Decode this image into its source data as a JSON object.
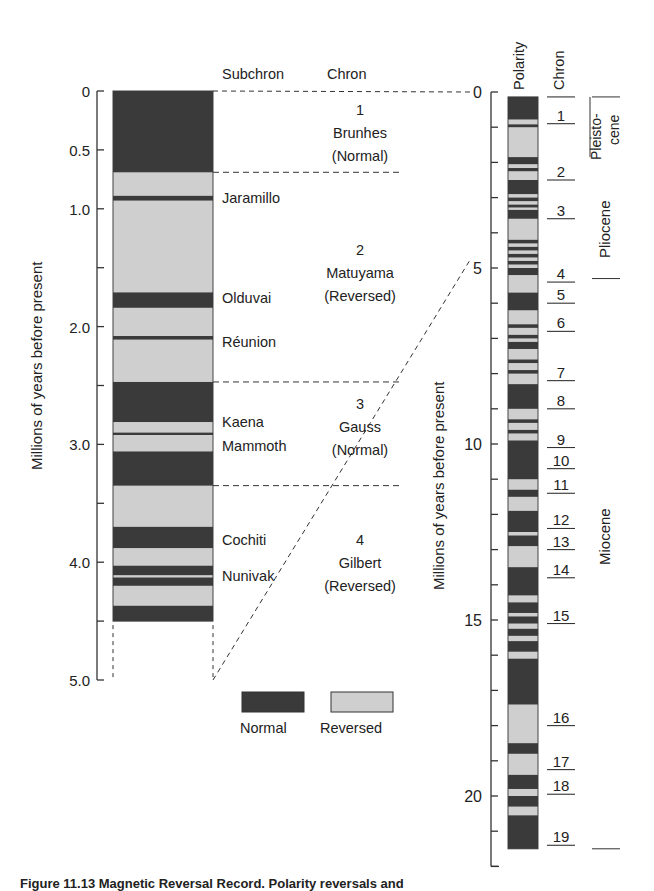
{
  "chart_data": {
    "type": "diagram",
    "left_panel": {
      "ylabel": "Millions of years before present",
      "yticks": [
        "0",
        "0.5",
        "1.0",
        "2.0",
        "3.0",
        "4.0",
        "5.0"
      ],
      "ylim": [
        0,
        5.0
      ],
      "column_headers": [
        "Subchron",
        "Chron"
      ],
      "normal_bands_ma": [
        [
          0,
          0.69
        ],
        [
          0.89,
          0.93
        ],
        [
          1.71,
          1.84
        ],
        [
          2.08,
          2.11
        ],
        [
          2.47,
          2.81
        ],
        [
          2.9,
          2.92
        ],
        [
          3.06,
          3.35
        ],
        [
          3.7,
          3.88
        ],
        [
          4.03,
          4.11
        ],
        [
          4.13,
          4.2
        ],
        [
          4.37,
          4.5
        ]
      ],
      "column_end_ma": 4.5,
      "subchrons": [
        {
          "name": "Jaramillo",
          "age": 0.91
        },
        {
          "name": "Olduvai",
          "age": 1.78
        },
        {
          "name": "Réunion",
          "age": 2.14
        },
        {
          "name": "Kaena",
          "age": 2.84
        },
        {
          "name": "Mammoth",
          "age": 3.0
        },
        {
          "name": "Cochiti",
          "age": 3.79
        },
        {
          "name": "Nunivak",
          "age": 4.09
        }
      ],
      "chrons": [
        {
          "number": "1",
          "name": "Brunhes",
          "polarity": "(Normal)",
          "start": 0,
          "end": 0.69
        },
        {
          "number": "2",
          "name": "Matuyama",
          "polarity": "(Reversed)",
          "start": 0.69,
          "end": 2.47
        },
        {
          "number": "3",
          "name": "Gauss",
          "polarity": "(Normal)",
          "start": 2.47,
          "end": 3.35
        },
        {
          "number": "4",
          "name": "Gilbert",
          "polarity": "(Reversed)",
          "start": 3.35,
          "end": 5.0
        }
      ]
    },
    "right_panel": {
      "ylabel": "Millions of years before present",
      "yticks": [
        "0",
        "5",
        "10",
        "15",
        "20"
      ],
      "ylim": [
        0,
        22
      ],
      "column_headers": [
        "Polarity",
        "Chron"
      ],
      "column_end_ma": 21.5,
      "normal_bands_ma": [
        [
          0,
          0.78
        ],
        [
          0.92,
          1.0
        ],
        [
          1.85,
          2.05
        ],
        [
          2.16,
          2.25
        ],
        [
          2.5,
          2.9
        ],
        [
          3.0,
          3.1
        ],
        [
          3.2,
          3.28
        ],
        [
          3.35,
          3.6
        ],
        [
          4.2,
          4.3
        ],
        [
          4.4,
          4.5
        ],
        [
          4.6,
          4.7
        ],
        [
          4.8,
          4.9
        ],
        [
          5.0,
          5.2
        ],
        [
          5.7,
          6.2
        ],
        [
          6.6,
          6.7
        ],
        [
          6.9,
          7.0
        ],
        [
          7.1,
          7.3
        ],
        [
          7.6,
          7.7
        ],
        [
          7.9,
          8.0
        ],
        [
          8.3,
          9.0
        ],
        [
          9.3,
          9.4
        ],
        [
          9.6,
          9.7
        ],
        [
          9.9,
          11.0
        ],
        [
          11.3,
          11.5
        ],
        [
          11.9,
          12.5
        ],
        [
          12.6,
          12.9
        ],
        [
          13.5,
          14.3
        ],
        [
          14.5,
          14.8
        ],
        [
          14.9,
          15.1
        ],
        [
          15.25,
          15.45
        ],
        [
          15.6,
          15.9
        ],
        [
          16.1,
          17.4
        ],
        [
          18.5,
          18.8
        ],
        [
          19.4,
          19.8
        ],
        [
          20.0,
          20.3
        ],
        [
          20.55,
          21.5
        ]
      ],
      "chron_numbers": [
        {
          "label": "1",
          "age": 0.9
        },
        {
          "label": "2",
          "age": 2.5
        },
        {
          "label": "3",
          "age": 3.6
        },
        {
          "label": "4",
          "age": 5.4
        },
        {
          "label": "5",
          "age": 6.0
        },
        {
          "label": "6",
          "age": 6.8
        },
        {
          "label": "7",
          "age": 8.2
        },
        {
          "label": "8",
          "age": 9.0
        },
        {
          "label": "9",
          "age": 10.1
        },
        {
          "label": "10",
          "age": 10.7
        },
        {
          "label": "11",
          "age": 11.4
        },
        {
          "label": "12",
          "age": 12.4
        },
        {
          "label": "13",
          "age": 13.0
        },
        {
          "label": "14",
          "age": 13.8
        },
        {
          "label": "15",
          "age": 15.1
        },
        {
          "label": "16",
          "age": 18.0
        },
        {
          "label": "17",
          "age": 19.25
        },
        {
          "label": "18",
          "age": 19.95
        },
        {
          "label": "19",
          "age": 21.4
        }
      ],
      "epochs": [
        {
          "name": "Pleistocene",
          "label_lines": [
            "Pleisto-",
            "cene"
          ],
          "start": 0,
          "end": 1.8
        },
        {
          "name": "Pliocene",
          "start": 1.8,
          "end": 5.3
        },
        {
          "name": "Miocene",
          "start": 5.3,
          "end": 21.5
        }
      ]
    },
    "legend": [
      {
        "label": "Normal",
        "color": "#3a3a3a"
      },
      {
        "label": "Reversed",
        "color": "#cfcfcf"
      }
    ]
  },
  "labels": {
    "left_ylabel": "Millions of years before present",
    "right_ylabel": "Millions of years before present",
    "subchron_header": "Subchron",
    "chron_header": "Chron",
    "polarity_header": "Polarity",
    "right_chron_header": "Chron",
    "legend_normal": "Normal",
    "legend_reversed": "Reversed",
    "caption": "Figure 11.13  Magnetic Reversal Record.  Polarity reversals and"
  },
  "colors": {
    "normal": "#3a3a3a",
    "reversed": "#cfcfcf",
    "line": "#333333"
  }
}
